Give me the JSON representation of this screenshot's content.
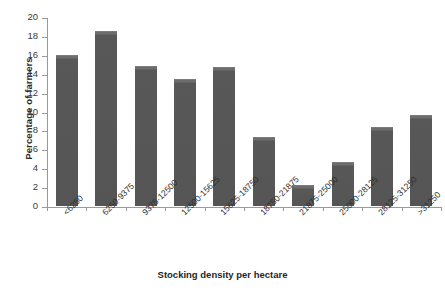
{
  "chart_data": {
    "type": "bar",
    "title": "",
    "xlabel": "Stocking density per hectare",
    "ylabel": "Percentage of farmers",
    "categories": [
      "<6250",
      "6250-9375",
      "9375-12500",
      "12500-15625",
      "15625-18750",
      "18750-21875",
      "21875-25000",
      "25000-28125",
      "28125-31250",
      ">31250"
    ],
    "values": [
      16.0,
      18.5,
      14.8,
      13.4,
      14.7,
      7.3,
      2.2,
      4.7,
      8.4,
      9.6
    ],
    "ylim": [
      0,
      20
    ],
    "yticks": [
      0,
      2,
      4,
      6,
      8,
      10,
      12,
      14,
      16,
      18,
      20
    ],
    "ytick_labels": [
      "0",
      "2",
      "4",
      "6",
      "8",
      "10",
      "12",
      "14",
      "16",
      "18",
      "20"
    ],
    "grid": false,
    "legend": false,
    "bar_color": "#555555",
    "axis_color": "#9a9a9a",
    "background": "#ffffff"
  }
}
